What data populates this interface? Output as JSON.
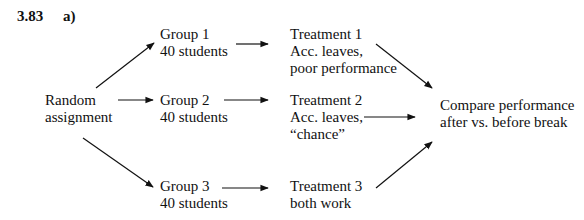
{
  "header": {
    "problem_number": "3.83",
    "part": "a)"
  },
  "diagram": {
    "source": {
      "line1": "Random",
      "line2": "assignment"
    },
    "groups": [
      {
        "line1": "Group 1",
        "line2": "40 students"
      },
      {
        "line1": "Group 2",
        "line2": "40 students"
      },
      {
        "line1": "Group 3",
        "line2": "40 students"
      }
    ],
    "treatments": [
      {
        "line1": "Treatment 1",
        "line2": "Acc. leaves,",
        "line3": "poor performance"
      },
      {
        "line1": "Treatment 2",
        "line2": "Acc. leaves,",
        "line3": "“chance”"
      },
      {
        "line1": "Treatment 3",
        "line2": "both work"
      }
    ],
    "outcome": {
      "line1": "Compare performance",
      "line2": "after vs. before break"
    }
  }
}
